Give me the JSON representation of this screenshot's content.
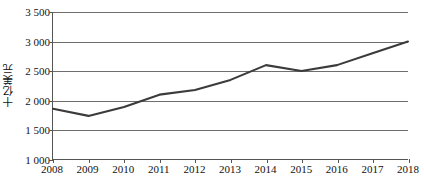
{
  "chart_data": {
    "type": "line",
    "title": "",
    "subtitle": "",
    "xlabel": "",
    "ylabel": "十亿美元",
    "categories": [
      "2008",
      "2009",
      "2010",
      "2011",
      "2012",
      "2013",
      "2014",
      "2015",
      "2016",
      "2017",
      "2018"
    ],
    "x": [
      2008,
      2009,
      2010,
      2011,
      2012,
      2013,
      2014,
      2015,
      2016,
      2017,
      2018
    ],
    "values": [
      1860,
      1740,
      1890,
      2100,
      2180,
      2350,
      2600,
      2500,
      2600,
      2800,
      3000
    ],
    "series": [
      {
        "name": "",
        "values": [
          1860,
          1740,
          1890,
          2100,
          2180,
          2350,
          2600,
          2500,
          2600,
          2800,
          3000
        ]
      }
    ],
    "ylim": [
      1000,
      3500
    ],
    "xlim": [
      2008,
      2018
    ],
    "y_ticks": [
      1000,
      1500,
      2000,
      2500,
      3000,
      3500
    ],
    "y_tick_labels": [
      "1 000",
      "1 500",
      "2 000",
      "2 500",
      "3 000",
      "3 500"
    ],
    "x_ticks": [
      2008,
      2009,
      2010,
      2011,
      2012,
      2013,
      2014,
      2015,
      2016,
      2017,
      2018
    ],
    "x_tick_labels": [
      "2008",
      "2009",
      "2010",
      "2011",
      "2012",
      "2013",
      "2014",
      "2015",
      "2016",
      "2017",
      "2018"
    ],
    "grid": true,
    "grid_axis": "y",
    "legend": false,
    "legend_position": "none",
    "annotations": [],
    "line_color": "#3b3b3b",
    "line_width": 2.1,
    "markers": false,
    "background_color": "#ffffff",
    "axis_color": "#555555",
    "gridline_color": "#6e6e6e",
    "text_color": "#111111"
  }
}
